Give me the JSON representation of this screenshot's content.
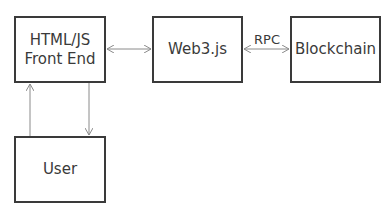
{
  "diagram": {
    "nodes": [
      {
        "id": "front_end",
        "label_lines": [
          "HTML/JS",
          "Front End"
        ]
      },
      {
        "id": "web3",
        "label": "Web3.js"
      },
      {
        "id": "blockchain",
        "label": "Blockchain"
      },
      {
        "id": "user",
        "label": "User"
      }
    ],
    "edges": [
      {
        "from": "front_end",
        "to": "web3",
        "direction": "both",
        "label": ""
      },
      {
        "from": "web3",
        "to": "blockchain",
        "direction": "both",
        "label": "RPC"
      },
      {
        "from": "user",
        "to": "front_end",
        "direction": "forward",
        "label": ""
      },
      {
        "from": "front_end",
        "to": "user",
        "direction": "forward",
        "label": ""
      }
    ],
    "rpc_label": "RPC",
    "colors": {
      "stroke": "#3a3a3a",
      "arrow": "#8a8a8a",
      "background": "#ffffff"
    }
  }
}
